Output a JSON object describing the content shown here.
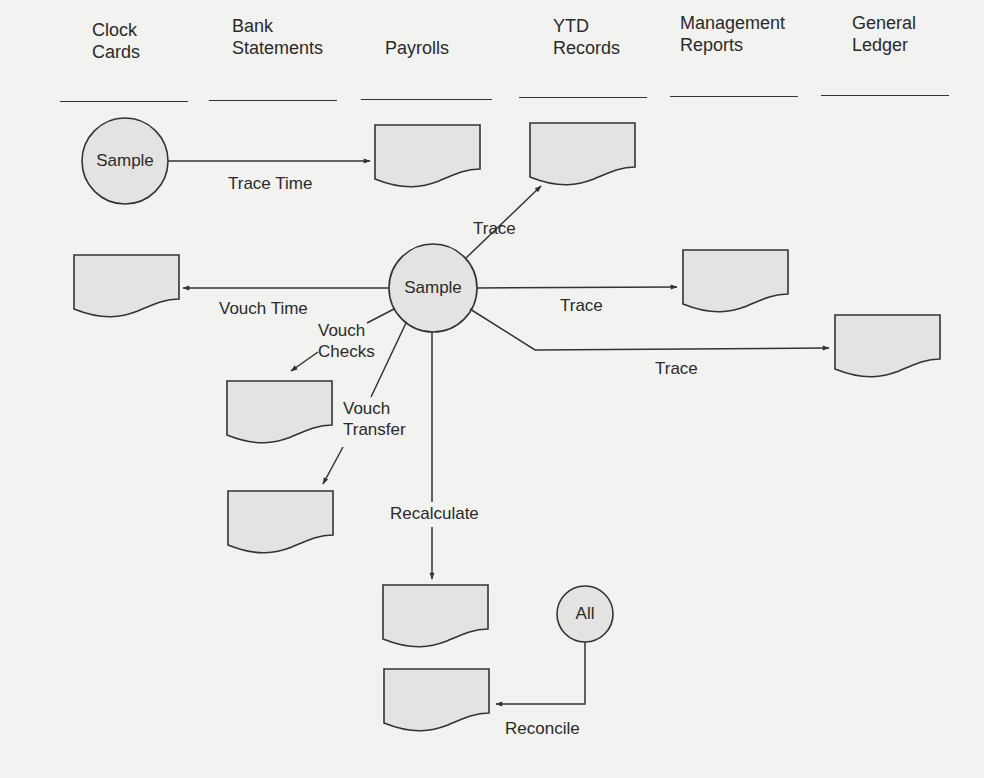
{
  "diagram": {
    "type": "audit-flowchart",
    "colors": {
      "background": "#f2f2f0",
      "shape_fill": "#e3e3e1",
      "stroke": "#333333",
      "text": "#2a2a2a"
    },
    "columns": [
      {
        "id": "clock-cards",
        "line1": "Clock",
        "line2": "Cards"
      },
      {
        "id": "bank-statements",
        "line1": "Bank",
        "line2": "Statements"
      },
      {
        "id": "payrolls",
        "line1": "",
        "line2": "Payrolls"
      },
      {
        "id": "ytd-records",
        "line1": "YTD",
        "line2": "Records"
      },
      {
        "id": "management-reports",
        "line1": "Management",
        "line2": "Reports"
      },
      {
        "id": "general-ledger",
        "line1": "General",
        "line2": "Ledger"
      }
    ],
    "nodes": {
      "sample_clock": "Sample",
      "sample_center": "Sample",
      "all": "All"
    },
    "edges": {
      "trace_time": "Trace Time",
      "trace_ytd": "Trace",
      "vouch_time": "Vouch Time",
      "trace_mgmt": "Trace",
      "trace_gl": "Trace",
      "vouch_checks_1": "Vouch",
      "vouch_checks_2": "Checks",
      "vouch_transfer_1": "Vouch",
      "vouch_transfer_2": "Transfer",
      "recalculate": "Recalculate",
      "reconcile": "Reconcile"
    }
  }
}
